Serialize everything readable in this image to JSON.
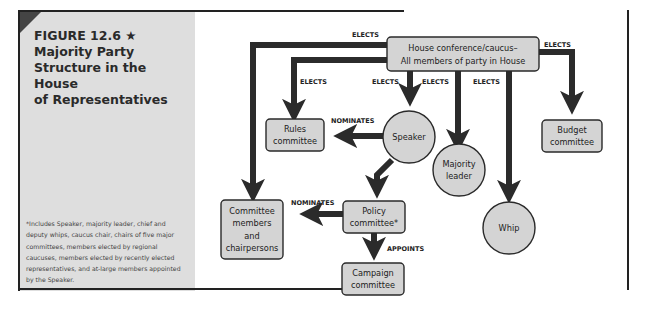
{
  "figure": {
    "number": "FIGURE 12.6 ★",
    "title": "Majority Party Structure in the House of Representatives",
    "title_lines": [
      "Majority Party",
      "Structure in the House",
      "of Representatives"
    ],
    "footnote": "*Includes Speaker, majority leader, chief and deputy whips, caucus chair, chairs of five major committees, members elected by regional caucuses, members elected by recently elected representatives, and at-large members appointed by the Speaker."
  },
  "colors": {
    "node_fill": "#d4d4d4",
    "node_stroke": "#2a2a2a",
    "arrow": "#2b2b2b",
    "sidebar_bg": "#dedede"
  },
  "nodes": {
    "caucus": {
      "line1": "House conference/caucus–",
      "line2": "All members of party in House",
      "shape": "rect"
    },
    "rules": {
      "line1": "Rules",
      "line2": "committee",
      "shape": "rect"
    },
    "speaker": {
      "line1": "Speaker",
      "shape": "circle"
    },
    "majority_leader": {
      "line1": "Majority",
      "line2": "leader",
      "shape": "circle"
    },
    "whip": {
      "line1": "Whip",
      "shape": "circle"
    },
    "budget": {
      "line1": "Budget",
      "line2": "committee",
      "shape": "rect"
    },
    "committee_members": {
      "line1": "Committee",
      "line2": "members",
      "line3": "and",
      "line4": "chairpersons",
      "shape": "rect"
    },
    "policy": {
      "line1": "Policy",
      "line2": "committee*",
      "shape": "rect"
    },
    "campaign": {
      "line1": "Campaign",
      "line2": "committee",
      "shape": "rect"
    }
  },
  "edges": {
    "caucus_to_committee_members": "ELECTS",
    "caucus_to_rules": "ELECTS",
    "caucus_to_speaker": "ELECTS",
    "caucus_to_majority_leader": "ELECTS",
    "caucus_to_whip": "ELECTS",
    "caucus_to_budget": "ELECTS",
    "speaker_to_rules": "NOMINATES",
    "policy_to_committee_members": "NOMINATES",
    "policy_to_campaign": "APPOINTS"
  }
}
